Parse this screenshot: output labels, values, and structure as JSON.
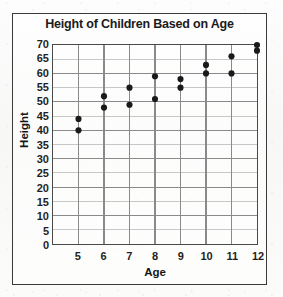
{
  "chart_data": {
    "type": "scatter",
    "title": "Height of Children Based on Age",
    "xlabel": "Age",
    "ylabel": "Height",
    "xlim": [
      4,
      12
    ],
    "ylim": [
      0,
      70
    ],
    "x_ticks": [
      5,
      6,
      7,
      8,
      9,
      10,
      11,
      12
    ],
    "y_ticks": [
      0,
      5,
      10,
      15,
      20,
      25,
      30,
      35,
      40,
      45,
      50,
      55,
      60,
      65,
      70
    ],
    "x_tick_labels": [
      "5",
      "6",
      "7",
      "8",
      "9",
      "10",
      "11",
      "12"
    ],
    "y_tick_labels": [
      "70",
      "65",
      "60",
      "55",
      "50",
      "45",
      "40",
      "35",
      "30",
      "25",
      "20",
      "15",
      "10",
      "5",
      "0"
    ],
    "grid": true,
    "grid_major_every": 10,
    "legend": null,
    "marker": "filled-circle",
    "marker_color": "#1a1a1a",
    "points": [
      {
        "x": 5,
        "y": 44
      },
      {
        "x": 5,
        "y": 40
      },
      {
        "x": 6,
        "y": 52
      },
      {
        "x": 6,
        "y": 48
      },
      {
        "x": 7,
        "y": 55
      },
      {
        "x": 7,
        "y": 49
      },
      {
        "x": 8,
        "y": 59
      },
      {
        "x": 8,
        "y": 51
      },
      {
        "x": 9,
        "y": 58
      },
      {
        "x": 9,
        "y": 55
      },
      {
        "x": 10,
        "y": 63
      },
      {
        "x": 10,
        "y": 60
      },
      {
        "x": 11,
        "y": 66
      },
      {
        "x": 11,
        "y": 60
      },
      {
        "x": 12,
        "y": 70
      },
      {
        "x": 12,
        "y": 68
      }
    ]
  },
  "colors": {
    "marker": "#1a1a1a",
    "axis": "#4a4a4a",
    "grid_minor": "#b8b8b8",
    "grid_major": "#8a8a8a",
    "frame": "#3a3a3a",
    "text": "#1b1b1b"
  }
}
